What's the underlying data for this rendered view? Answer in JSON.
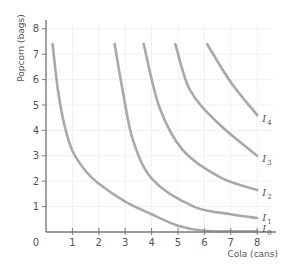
{
  "chart_data": {
    "type": "line",
    "title": "",
    "xlabel": "Cola (cans)",
    "ylabel": "Popcorn (bags)",
    "xlim": [
      0,
      8
    ],
    "ylim": [
      0,
      8
    ],
    "x_ticks": [
      "0",
      "1",
      "2",
      "3",
      "4",
      "5",
      "6",
      "7",
      "8"
    ],
    "y_ticks": [
      "1",
      "2",
      "3",
      "4",
      "5",
      "6",
      "7",
      "8"
    ],
    "grid": true,
    "legend": "none (inline curve labels at right end)",
    "colors": {
      "curve": "#a9a9a9",
      "axis": "#7a7a7a",
      "grid": "#f1f1f1",
      "text": "#555555"
    },
    "series": [
      {
        "name": "I0",
        "label_main": "I",
        "label_sub": "0",
        "points": [
          [
            0.25,
            7.4
          ],
          [
            0.45,
            5.6
          ],
          [
            0.7,
            4.2
          ],
          [
            1.0,
            3.2
          ],
          [
            1.5,
            2.4
          ],
          [
            2.0,
            1.9
          ],
          [
            3.0,
            1.2
          ],
          [
            4.0,
            0.7
          ],
          [
            5.0,
            0.25
          ],
          [
            6.0,
            0.05
          ],
          [
            8.0,
            0.03
          ]
        ]
      },
      {
        "name": "I1",
        "label_main": "I",
        "label_sub": "1",
        "points": [
          [
            2.6,
            7.4
          ],
          [
            2.9,
            5.6
          ],
          [
            3.3,
            3.6
          ],
          [
            4.05,
            2.05
          ],
          [
            5.6,
            1.0
          ],
          [
            7.0,
            0.7
          ],
          [
            8.0,
            0.55
          ]
        ]
      },
      {
        "name": "I2",
        "label_main": "I",
        "label_sub": "2",
        "points": [
          [
            3.7,
            7.4
          ],
          [
            4.3,
            4.9
          ],
          [
            5.2,
            3.2
          ],
          [
            6.6,
            2.15
          ],
          [
            8.0,
            1.65
          ]
        ]
      },
      {
        "name": "I3",
        "label_main": "I",
        "label_sub": "3",
        "points": [
          [
            4.9,
            7.4
          ],
          [
            5.45,
            5.6
          ],
          [
            6.5,
            4.3
          ],
          [
            8.0,
            3.0
          ]
        ]
      },
      {
        "name": "I4",
        "label_main": "I",
        "label_sub": "4",
        "points": [
          [
            6.1,
            7.4
          ],
          [
            7.0,
            5.9
          ],
          [
            8.0,
            4.6
          ]
        ]
      }
    ]
  }
}
